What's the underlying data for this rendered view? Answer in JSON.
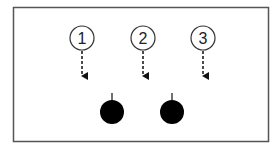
{
  "diagram": {
    "frame": {
      "x": 13,
      "y": 7,
      "width": 256,
      "height": 135,
      "stroke": "#555555"
    },
    "markers": [
      {
        "label": "1",
        "cx": 82,
        "cy": 38
      },
      {
        "label": "2",
        "cx": 143,
        "cy": 38
      },
      {
        "label": "3",
        "cx": 203,
        "cy": 38
      }
    ],
    "arrow_style": "dashed-down",
    "dots": [
      {
        "cx": 112,
        "cy": 112,
        "fill": "#000000"
      },
      {
        "cx": 172,
        "cy": 112,
        "fill": "#000000"
      }
    ]
  }
}
